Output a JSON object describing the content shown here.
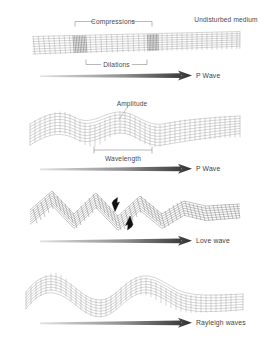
{
  "figure": {
    "background": "#ffffff",
    "mesh_color": "#9b9b9b",
    "text_color": "#4a4a4a",
    "arrow_dark": "#3d3d3d",
    "arrow_light": "#d8d8d8"
  },
  "panels": [
    {
      "id": "p-wave-compression",
      "wave_label": "P Wave",
      "annotations": [
        {
          "name": "compressions",
          "text": "Compressions"
        },
        {
          "name": "undisturbed-medium",
          "text": "Undisturbed medium"
        },
        {
          "name": "dilations",
          "text": "Dilations"
        }
      ]
    },
    {
      "id": "p-wave-amplitude",
      "wave_label": "P Wave",
      "annotations": [
        {
          "name": "amplitude",
          "text": "Amplitude"
        },
        {
          "name": "wavelength",
          "text": "Wavelength"
        }
      ]
    },
    {
      "id": "love-wave",
      "wave_label": "Love wave",
      "annotations": []
    },
    {
      "id": "rayleigh-wave",
      "wave_label": "Rayleigh waves",
      "annotations": []
    }
  ],
  "labels": {
    "compressions": "Compressions",
    "undisturbed_medium": "Undisturbed medium",
    "dilations": "Dilations",
    "amplitude": "Amplitude",
    "wavelength": "Wavelength",
    "p_wave_1": "P Wave",
    "p_wave_2": "P Wave",
    "love_wave": "Love wave",
    "rayleigh_waves": "Rayleigh waves"
  }
}
